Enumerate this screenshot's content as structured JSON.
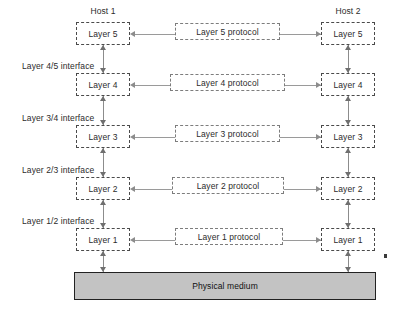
{
  "diagram": {
    "hosts": [
      {
        "id": "host1",
        "label": "Host 1"
      },
      {
        "id": "host2",
        "label": "Host 2"
      }
    ],
    "layers": [
      {
        "level": 5,
        "label": "Layer 5",
        "protocol_label": "Layer 5 protocol"
      },
      {
        "level": 4,
        "label": "Layer 4",
        "protocol_label": "Layer 4 protocol"
      },
      {
        "level": 3,
        "label": "Layer 3",
        "protocol_label": "Layer 3 protocol"
      },
      {
        "level": 2,
        "label": "Layer 2",
        "protocol_label": "Layer 2 protocol"
      },
      {
        "level": 1,
        "label": "Layer 1",
        "protocol_label": "Layer 1 protocol"
      }
    ],
    "interfaces": [
      {
        "label": "Layer 4/5 interface"
      },
      {
        "label": "Layer 3/4 interface"
      },
      {
        "label": "Layer 2/3 interface"
      },
      {
        "label": "Layer 1/2 interface"
      }
    ],
    "medium": {
      "label": "Physical medium"
    },
    "colors": {
      "medium_fill": "#c3c3c3",
      "medium_border": "#222222",
      "box_border": "#4a4a4a",
      "connector": "#9a9a9a",
      "text": "#2b2b2b"
    }
  }
}
